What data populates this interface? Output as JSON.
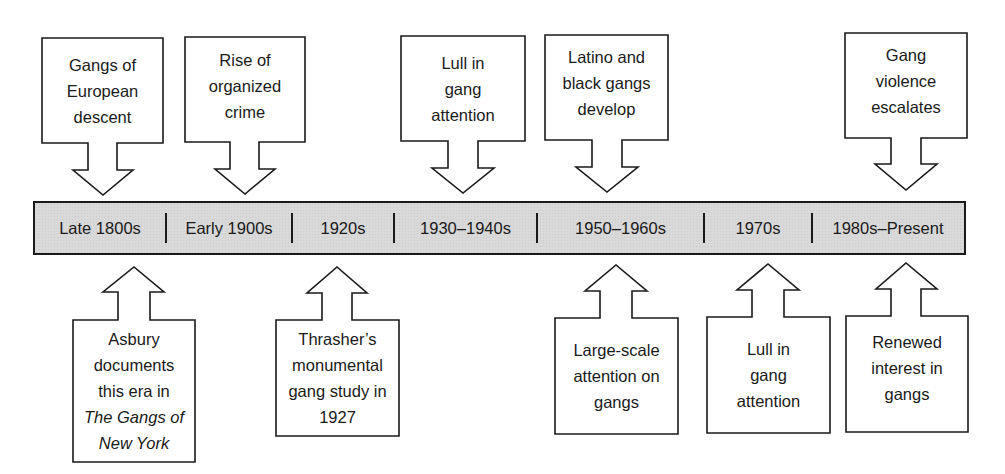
{
  "diagram": {
    "type": "timeline",
    "colors": {
      "bar_fill": "#d9d9d9",
      "stroke": "#1a1a1a",
      "background": "#ffffff"
    },
    "timeline": {
      "eras": [
        {
          "label": "Late 1800s"
        },
        {
          "label": "Early 1900s"
        },
        {
          "label": "1920s"
        },
        {
          "label": "1930–1940s"
        },
        {
          "label": "1950–1960s"
        },
        {
          "label": "1970s"
        },
        {
          "label": "1980s–Present"
        }
      ]
    },
    "top_callouts": [
      {
        "era": "Late 1800s",
        "lines": [
          "Gangs of",
          "European",
          "descent"
        ]
      },
      {
        "era": "Early 1900s",
        "lines": [
          "Rise of",
          "organized",
          "crime"
        ]
      },
      {
        "era": "1930–1940s",
        "lines": [
          "Lull in",
          "gang",
          "attention"
        ]
      },
      {
        "era": "1950–1960s",
        "lines": [
          "Latino and",
          "black gangs",
          "develop"
        ]
      },
      {
        "era": "1980s–Present",
        "lines": [
          "Gang",
          "violence",
          "escalates"
        ]
      }
    ],
    "bottom_callouts": [
      {
        "era": "Late 1800s",
        "lines": [
          "Asbury",
          "documents",
          "this era in",
          "The Gangs of",
          "New York"
        ],
        "italic_lines": [
          3,
          4
        ]
      },
      {
        "era": "1920s",
        "lines": [
          "Thrasher’s",
          "monumental",
          "gang study in",
          "1927"
        ]
      },
      {
        "era": "1950–1960s",
        "lines": [
          "Large-scale",
          "attention on",
          "gangs"
        ]
      },
      {
        "era": "1970s",
        "lines": [
          "Lull in",
          "gang",
          "attention"
        ]
      },
      {
        "era": "1980s–Present",
        "lines": [
          "Renewed",
          "interest in",
          "gangs"
        ]
      }
    ]
  }
}
